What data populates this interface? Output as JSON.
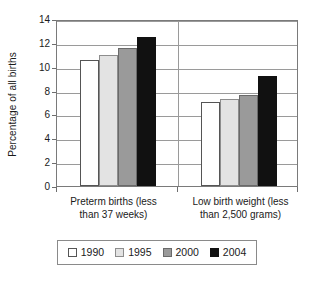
{
  "chart_data": {
    "type": "bar",
    "title": "",
    "subtitle": "",
    "xlabel": "",
    "ylabel": "Percentage of all births",
    "ylim": [
      0,
      14
    ],
    "ytick_step": 2,
    "yticks": [
      "0",
      "2",
      "4",
      "6",
      "8",
      "10",
      "12",
      "14"
    ],
    "grid": true,
    "grid_axis": "y",
    "legend_position": "bottom",
    "categories": [
      "Preterm births (less than 37 weeks)",
      "Low birth weight (less than 2,500 grams)"
    ],
    "category_lines": [
      [
        "Preterm births (less",
        "than 37 weeks)"
      ],
      [
        "Low birth weight (less",
        "than 2,500 grams)"
      ]
    ],
    "series": [
      {
        "name": "1990",
        "color": "#ffffff",
        "values": [
          10.6,
          7.0
        ]
      },
      {
        "name": "1995",
        "color": "#e3e3e3",
        "values": [
          11.0,
          7.3
        ]
      },
      {
        "name": "2000",
        "color": "#9a9a9a",
        "values": [
          11.6,
          7.6
        ]
      },
      {
        "name": "2004",
        "color": "#111111",
        "values": [
          12.5,
          9.2
        ]
      }
    ]
  },
  "legend": {
    "items": [
      {
        "label": "1990",
        "swatch": "white-square-icon"
      },
      {
        "label": "1995",
        "swatch": "light-gray-square-icon"
      },
      {
        "label": "2000",
        "swatch": "medium-gray-square-icon"
      },
      {
        "label": "2004",
        "swatch": "black-square-icon"
      }
    ]
  },
  "colors": {
    "series_1990": "#ffffff",
    "series_1995": "#e3e3e3",
    "series_2000": "#9a9a9a",
    "series_2004": "#111111",
    "axis": "#7a7a7a",
    "grid": "#9a9a9a",
    "text": "#1a1a1a"
  }
}
